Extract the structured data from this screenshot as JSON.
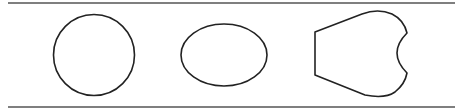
{
  "diagram": {
    "stroke_color": "#222222",
    "line_color": "#555555",
    "shapes": [
      {
        "name": "circle",
        "type": "circle",
        "cx": 94,
        "cy": 55,
        "r": 40
      },
      {
        "name": "ellipse",
        "type": "ellipse",
        "cx": 225,
        "cy": 55,
        "rx": 43,
        "ry": 32
      },
      {
        "name": "notched-shape",
        "type": "path"
      }
    ],
    "lines": [
      {
        "name": "top-line",
        "y": 3,
        "x1": 8,
        "x2": 455
      },
      {
        "name": "bottom-line",
        "y": 107,
        "x1": 8,
        "x2": 455
      }
    ]
  }
}
